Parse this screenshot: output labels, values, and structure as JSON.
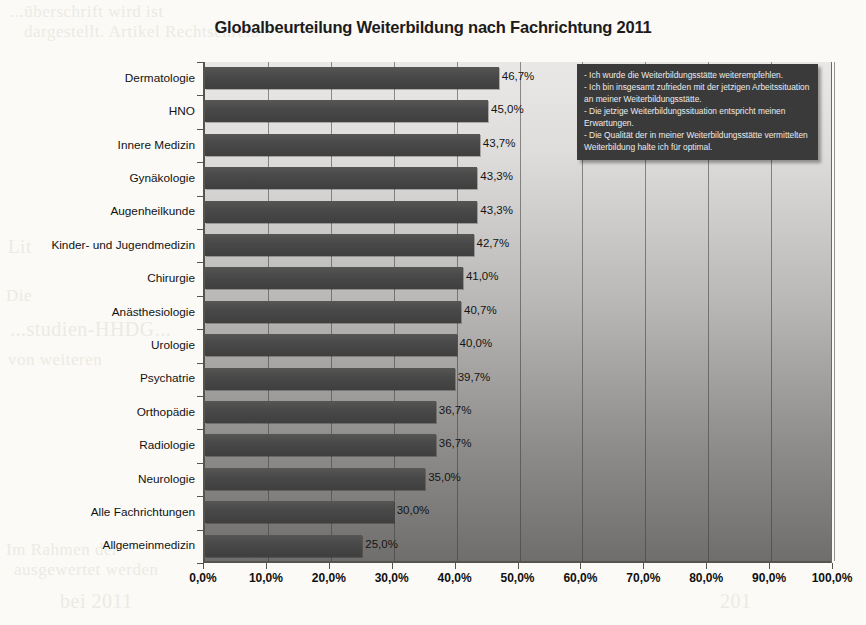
{
  "chart_data": {
    "type": "bar",
    "orientation": "horizontal",
    "title": "Globalbeurteilung Weiterbildung nach Fachrichtung 2011",
    "xlabel": "",
    "ylabel": "",
    "xlim": [
      0,
      100
    ],
    "grid": true,
    "legend_position": "top-right",
    "categories": [
      "Dermatologie",
      "HNO",
      "Innere Medizin",
      "Gynäkologie",
      "Augenheilkunde",
      "Kinder- und Jugendmedizin",
      "Chirurgie",
      "Anästhesiologie",
      "Urologie",
      "Psychatrie",
      "Orthopädie",
      "Radiologie",
      "Neurologie",
      "Alle Fachrichtungen",
      "Allgemeinmedizin"
    ],
    "values": [
      46.7,
      45.0,
      43.7,
      43.3,
      43.3,
      42.7,
      41.0,
      40.7,
      40.0,
      39.7,
      36.7,
      36.7,
      35.0,
      30.0,
      25.0
    ],
    "data_labels": [
      "46,7%",
      "45,0%",
      "43,7%",
      "43,3%",
      "43,3%",
      "42,7%",
      "41,0%",
      "40,7%",
      "40,0%",
      "39,7%",
      "36,7%",
      "36,7%",
      "35,0%",
      "30,0%",
      "25,0%"
    ],
    "xticks": [
      0,
      10,
      20,
      30,
      40,
      50,
      60,
      70,
      80,
      90,
      100
    ],
    "xtick_labels": [
      "0,0%",
      "10,0%",
      "20,0%",
      "30,0%",
      "40,0%",
      "50,0%",
      "60,0%",
      "70,0%",
      "80,0%",
      "90,0%",
      "100,0%"
    ],
    "annotation_lines": [
      "- Ich wurde die Weiterbildungsstätte weiterempfehlen.",
      "- Ich bin insgesamt zufrieden mit der jetzigen Arbeitssituation an meiner Weiterbildungsstätte.",
      "- Die jetzige Weiterbildungssituation entspricht meinen Erwartungen.",
      "- Die Qualität der in meiner Weiterbildungsstätte vermittelten Weiterbildung halte ich für optimal."
    ],
    "colors": {
      "bar": "#49494a",
      "plot_background_top": "#e9e8e6",
      "plot_background_bottom": "#6f6e6c",
      "annotation_background": "#3a3a3a",
      "annotation_text": "#ececec",
      "axis": "#55544f",
      "title": "#1c1c1c"
    }
  },
  "page_bleed": {
    "l1": "...überschrift wird ist",
    "l2": "dargestellt. Artikel Rechtschreib",
    "l3": "Lit",
    "l4": "Die",
    "l5": "...studien-HHDG...",
    "l6": "von weiteren",
    "l7": "Im Rahmen der",
    "l8": "ausgewertet werden",
    "l9": "bei 2011",
    "r1": "die",
    "r2": "201",
    "r3": "201"
  }
}
